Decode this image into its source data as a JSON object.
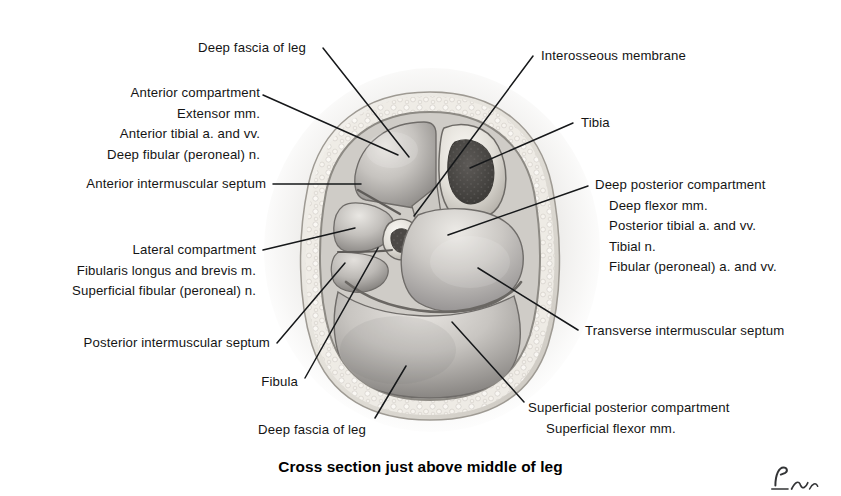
{
  "figure": {
    "caption": "Cross section just above middle of leg",
    "signature_name": "artist-signature"
  },
  "labels": {
    "deep_fascia_top": "Deep fascia of leg",
    "interosseous_membrane": "Interosseous membrane",
    "anterior_compartment": {
      "title": "Anterior compartment",
      "items": [
        "Extensor mm.",
        "Anterior tibial a. and vv.",
        "Deep fibular (peroneal) n."
      ]
    },
    "tibia": "Tibia",
    "anterior_intermuscular_septum": "Anterior intermuscular septum",
    "deep_posterior_compartment": {
      "title": "Deep posterior compartment",
      "items": [
        "Deep flexor mm.",
        "Posterior tibial a. and vv.",
        "Tibial n.",
        "Fibular (peroneal) a. and vv."
      ]
    },
    "lateral_compartment": {
      "title": "Lateral compartment",
      "items": [
        "Fibularis longus and brevis m.",
        "Superficial fibular (peroneal) n."
      ]
    },
    "posterior_intermuscular_septum": "Posterior intermuscular septum",
    "transverse_intermuscular_septum": "Transverse intermuscular septum",
    "fibula": "Fibula",
    "deep_fascia_bottom": "Deep fascia of leg",
    "superficial_posterior_compartment": {
      "title": "Superficial posterior compartment",
      "items": [
        "Superficial flexor mm."
      ]
    }
  },
  "colors": {
    "ink": "#141414",
    "leader": "#16181a",
    "page_background": "#ffffff",
    "fascia_rim": "#d7d4cf",
    "subcutaneous_fat": "#efece6",
    "muscle_light": "#d9d6d2",
    "muscle_mid": "#b9b6b2",
    "muscle_dark": "#8e8b88",
    "bone_cortex": "#e7e4de",
    "marrow_dark": "#4a4845"
  }
}
